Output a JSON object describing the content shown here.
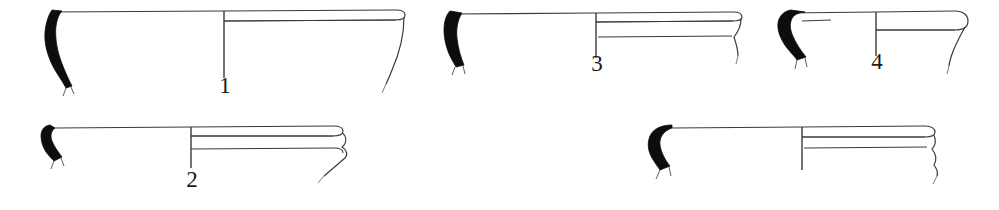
{
  "plate": {
    "kind": "archaeological-pottery-profile-plate",
    "background_color": "#ffffff",
    "ink_color": "#3a3a3a",
    "section_fill_color": "#0d0d0d",
    "label_color": "#1a1a1a",
    "width": 999,
    "height": 210,
    "caption": "",
    "figure_count": 5
  },
  "figures": [
    {
      "id": "figure-1",
      "label": "1",
      "row": "top",
      "label_x": 225,
      "label_y": 84,
      "label_size": 23,
      "axis_x": 224,
      "axis_top": 11,
      "axis_bottom": 78,
      "rim_left_x": 52,
      "rim_right_x": 404,
      "rim_y": 11,
      "base_y": 82,
      "rim_band": "single",
      "rim_profile": "flat everted rim, rounded outer lip, tapering wall",
      "section_shape": "long narrow S-curved band"
    },
    {
      "id": "figure-2",
      "label": "2",
      "row": "bottom",
      "label_x": 192,
      "label_y": 178,
      "label_size": 23,
      "axis_x": 191,
      "axis_top": 127,
      "axis_bottom": 168,
      "rim_left_x": 55,
      "rim_right_x": 343,
      "rim_y": 127,
      "base_y": 160,
      "rim_band": "double",
      "rim_profile": "shallow flanged rim with two exterior mouldings",
      "section_shape": "short stubby hooked band"
    },
    {
      "id": "figure-3",
      "label": "3",
      "row": "top",
      "label_x": 597,
      "label_y": 62,
      "label_size": 23,
      "axis_x": 596,
      "axis_top": 13,
      "axis_bottom": 58,
      "rim_left_x": 450,
      "rim_right_x": 742,
      "rim_y": 13,
      "base_y": 47,
      "rim_band": "double",
      "rim_profile": "flat rim with banded exterior and thickened lip",
      "section_shape": "tapering curved band"
    },
    {
      "id": "figure-4",
      "label": "4",
      "row": "top",
      "label_x": 877,
      "label_y": 58,
      "label_size": 23,
      "axis_x": 876,
      "axis_top": 12,
      "axis_bottom": 56,
      "rim_left_x": 786,
      "rim_right_x": 964,
      "rim_y": 12,
      "base_y": 42,
      "rim_band": "single",
      "rim_profile": "rounded everted rim with hooked section",
      "section_shape": "hooked curved band with tick mark"
    },
    {
      "id": "figure-5",
      "label": "5",
      "row": "bottom",
      "label_x": 803,
      "label_y": 178,
      "label_size": 23,
      "axis_x": 802,
      "axis_top": 127,
      "axis_bottom": 170,
      "rim_left_x": 672,
      "rim_right_x": 938,
      "rim_y": 127,
      "base_y": 160,
      "rim_band": "double",
      "rim_profile": "flat rim with broad exterior band and wavy wall",
      "section_shape": "broad blob-like band"
    }
  ]
}
